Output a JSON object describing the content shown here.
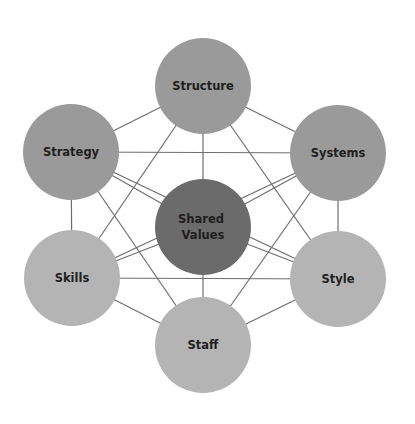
{
  "diagram": {
    "title": "",
    "colors": {
      "background": "#ffffff",
      "edge": "#6e6e6e",
      "label": "#1e1e1e",
      "hard": "#9a9a9a",
      "core": "#6b6b6b",
      "soft": "#b4b4b4"
    },
    "nodes": [
      {
        "id": "structure",
        "label": "Structure",
        "lines": [
          "Structure"
        ],
        "cx": 203,
        "cy": 86,
        "r": 48,
        "group": "hard"
      },
      {
        "id": "strategy",
        "label": "Strategy",
        "lines": [
          "Strategy"
        ],
        "cx": 71,
        "cy": 152,
        "r": 48,
        "group": "hard"
      },
      {
        "id": "systems",
        "label": "Systems",
        "lines": [
          "Systems"
        ],
        "cx": 338,
        "cy": 153,
        "r": 48,
        "group": "hard"
      },
      {
        "id": "shared-values",
        "label": "Shared Values",
        "lines": [
          "Shared",
          "Values"
        ],
        "cx": 203,
        "cy": 227,
        "r": 48,
        "group": "core"
      },
      {
        "id": "skills",
        "label": "Skills",
        "lines": [
          "Skills"
        ],
        "cx": 72,
        "cy": 278,
        "r": 48,
        "group": "soft"
      },
      {
        "id": "style",
        "label": "Style",
        "lines": [
          "Style"
        ],
        "cx": 338,
        "cy": 279,
        "r": 48,
        "group": "soft"
      },
      {
        "id": "staff",
        "label": "Staff",
        "lines": [
          "Staff"
        ],
        "cx": 203,
        "cy": 345,
        "r": 48,
        "group": "soft"
      }
    ],
    "edges": [
      [
        "structure",
        "strategy"
      ],
      [
        "structure",
        "systems"
      ],
      [
        "structure",
        "skills"
      ],
      [
        "structure",
        "style"
      ],
      [
        "structure",
        "shared-values"
      ],
      [
        "strategy",
        "systems"
      ],
      [
        "strategy",
        "skills"
      ],
      [
        "strategy",
        "staff"
      ],
      [
        "strategy",
        "style"
      ],
      [
        "strategy",
        "shared-values"
      ],
      [
        "systems",
        "style"
      ],
      [
        "systems",
        "staff"
      ],
      [
        "systems",
        "skills"
      ],
      [
        "systems",
        "shared-values"
      ],
      [
        "skills",
        "style"
      ],
      [
        "skills",
        "staff"
      ],
      [
        "skills",
        "shared-values"
      ],
      [
        "style",
        "staff"
      ],
      [
        "style",
        "shared-values"
      ],
      [
        "staff",
        "shared-values"
      ]
    ]
  }
}
